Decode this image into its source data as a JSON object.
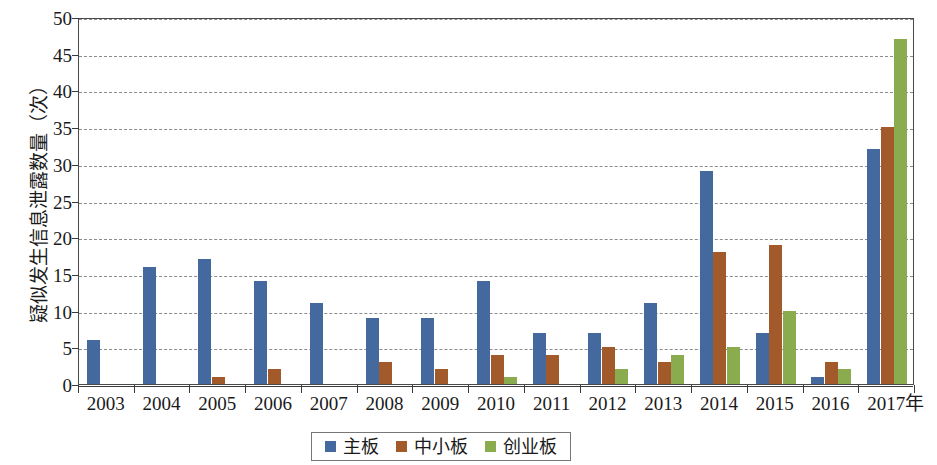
{
  "chart_data": {
    "type": "bar",
    "title": "",
    "xlabel": "年",
    "ylabel": "疑似发生信息泄露数量（次）",
    "categories": [
      "2003",
      "2004",
      "2005",
      "2006",
      "2007",
      "2008",
      "2009",
      "2010",
      "2011",
      "2012",
      "2013",
      "2014",
      "2015",
      "2016",
      "2017"
    ],
    "series": [
      {
        "name": "主板",
        "color": "#44699f",
        "values": [
          6,
          16,
          17,
          14,
          11,
          9,
          9,
          14,
          7,
          7,
          11,
          29,
          7,
          1,
          32
        ]
      },
      {
        "name": "中小板",
        "color": "#a35a2a",
        "values": [
          0,
          0,
          1,
          2,
          0,
          3,
          2,
          4,
          4,
          5,
          3,
          18,
          19,
          3,
          35
        ]
      },
      {
        "name": "创业板",
        "color": "#8aac4e",
        "values": [
          0,
          0,
          0,
          0,
          0,
          0,
          0,
          1,
          0,
          2,
          4,
          5,
          10,
          2,
          47
        ]
      }
    ],
    "ylim": [
      0,
      50
    ],
    "y_ticks": [
      0,
      5,
      10,
      15,
      20,
      25,
      30,
      35,
      40,
      45,
      50
    ],
    "y_tick_labels": [
      "0",
      "5",
      "10",
      "15",
      "20",
      "25",
      "30",
      "35",
      "40",
      "45",
      "50"
    ],
    "grid": true,
    "legend_position": "bottom"
  },
  "legend": {
    "items": [
      {
        "label": "主板"
      },
      {
        "label": "中小板"
      },
      {
        "label": "创业板"
      }
    ]
  }
}
